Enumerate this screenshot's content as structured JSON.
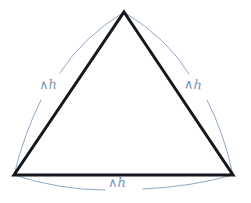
{
  "figure": {
    "type": "geometry-diagram",
    "background_color": "#ffffff",
    "triangle": {
      "name": "triangle",
      "stroke_color": "#16161f",
      "stroke_width": 3,
      "fill": "none",
      "vertices": [
        {
          "name": "apex",
          "x": 124,
          "y": 12
        },
        {
          "name": "bottom-right",
          "x": 233,
          "y": 175
        },
        {
          "name": "bottom-left",
          "x": 14,
          "y": 175
        }
      ]
    },
    "arcs": {
      "stroke_color": "#8fa9c6",
      "stroke_width": 1,
      "items": [
        {
          "name": "arc-left",
          "side": "left",
          "from": {
            "x": 124,
            "y": 12
          },
          "to": {
            "x": 14,
            "y": 175
          },
          "bulge": "outward-left"
        },
        {
          "name": "arc-right",
          "side": "right",
          "from": {
            "x": 124,
            "y": 12
          },
          "to": {
            "x": 233,
            "y": 175
          },
          "bulge": "outward-right"
        },
        {
          "name": "arc-bottom",
          "side": "bottom",
          "from": {
            "x": 14,
            "y": 175
          },
          "to": {
            "x": 233,
            "y": 175
          },
          "bulge": "outward-down"
        }
      ]
    },
    "labels": {
      "text_color": "#7a94b8",
      "items": [
        {
          "name": "label-left",
          "text": "∧h",
          "side": "left"
        },
        {
          "name": "label-right",
          "text": "∧h",
          "side": "right"
        },
        {
          "name": "label-bottom",
          "text": "∧h",
          "side": "bottom"
        }
      ]
    }
  }
}
